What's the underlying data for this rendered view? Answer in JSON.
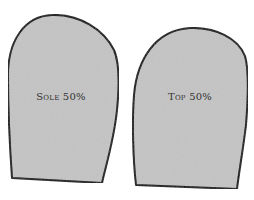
{
  "diagram": {
    "shapes": [
      {
        "id": "sole",
        "label": "Sole 50%",
        "fill": "#c4c4c4",
        "stroke": "#111111"
      },
      {
        "id": "top",
        "label": "Top 50%",
        "fill": "#c4c4c4",
        "stroke": "#111111"
      }
    ]
  }
}
